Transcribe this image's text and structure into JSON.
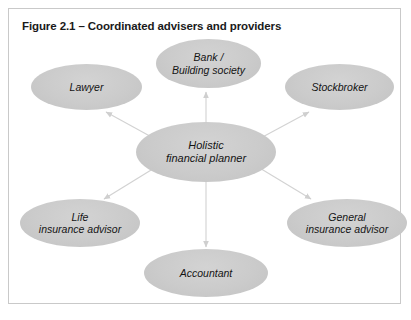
{
  "figure": {
    "title": "Figure 2.1 – Coordinated advisers and providers",
    "border_color": "#c9c9c9",
    "background_color": "#ffffff"
  },
  "diagram": {
    "type": "hub-and-spoke",
    "node_fill_color": "#cbcbcb",
    "connector_color": "#d0d0d0",
    "center": {
      "id": "holistic-financial-planner",
      "label": "Holistic\nfinancial planner"
    },
    "nodes": [
      {
        "id": "bank-building-society",
        "label": "Bank /\nBuilding society"
      },
      {
        "id": "lawyer",
        "label": "Lawyer"
      },
      {
        "id": "stockbroker",
        "label": "Stockbroker"
      },
      {
        "id": "life-insurance-advisor",
        "label": "Life\ninsurance advisor"
      },
      {
        "id": "general-insurance-advisor",
        "label": "General\ninsurance advisor"
      },
      {
        "id": "accountant",
        "label": "Accountant"
      }
    ],
    "connections": [
      {
        "from": "holistic-financial-planner",
        "to": "bank-building-society",
        "direction": "outward"
      },
      {
        "from": "holistic-financial-planner",
        "to": "lawyer",
        "direction": "outward"
      },
      {
        "from": "holistic-financial-planner",
        "to": "stockbroker",
        "direction": "outward"
      },
      {
        "from": "holistic-financial-planner",
        "to": "life-insurance-advisor",
        "direction": "outward"
      },
      {
        "from": "holistic-financial-planner",
        "to": "general-insurance-advisor",
        "direction": "outward"
      },
      {
        "from": "holistic-financial-planner",
        "to": "accountant",
        "direction": "outward"
      }
    ]
  }
}
